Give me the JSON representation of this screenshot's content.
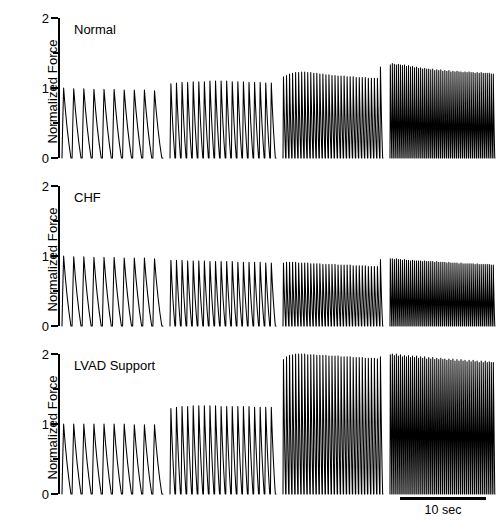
{
  "figure": {
    "axis_label": "Normalized Force",
    "y_ticks": [
      "0",
      "1",
      "2"
    ],
    "scalebar_label": "10 sec"
  },
  "panels": [
    {
      "title": "Normal"
    },
    {
      "title": "CHF"
    },
    {
      "title": "LVAD Support"
    }
  ],
  "chart_data": {
    "type": "line",
    "title": "",
    "xlabel": "",
    "ylabel": "Normalized Force",
    "ylim": [
      0,
      2
    ],
    "y_ticks": [
      0,
      0.5,
      1,
      1.5,
      2
    ],
    "y_tick_labels": [
      "0",
      "",
      "1",
      "",
      "2"
    ],
    "grid": false,
    "legend": "none",
    "x_scalebar": {
      "label": "10 sec",
      "length_sec": 10
    },
    "stimulation_groups": [
      {
        "group": 1,
        "beats": 10,
        "relative_rate": 1.0
      },
      {
        "group": 2,
        "beats": 19,
        "relative_rate": 1.9
      },
      {
        "group": 3,
        "beats": 33,
        "relative_rate": 3.3
      },
      {
        "group": 4,
        "beats": 52,
        "relative_rate": 5.2
      }
    ],
    "series": [
      {
        "name": "Normal",
        "peak_force_by_group": [
          1.0,
          1.08,
          1.2,
          1.32
        ],
        "peak_values": [
          1.0,
          0.99,
          0.99,
          0.98,
          0.98,
          0.98,
          0.97,
          0.97,
          0.97,
          0.96,
          1.06,
          1.07,
          1.08,
          1.08,
          1.09,
          1.09,
          1.09,
          1.1,
          1.1,
          1.1,
          1.1,
          1.09,
          1.09,
          1.09,
          1.08,
          1.08,
          1.08,
          1.07,
          1.07,
          1.16,
          1.18,
          1.2,
          1.21,
          1.22,
          1.22,
          1.23,
          1.23,
          1.22,
          1.22,
          1.21,
          1.21,
          1.2,
          1.2,
          1.19,
          1.19,
          1.18,
          1.18,
          1.17,
          1.17,
          1.17,
          1.16,
          1.16,
          1.16,
          1.15,
          1.15,
          1.15,
          1.15,
          1.14,
          1.14,
          1.14,
          1.14,
          1.3,
          1.33,
          1.35,
          1.34,
          1.33,
          1.34,
          1.33,
          1.32,
          1.33,
          1.31,
          1.32,
          1.3,
          1.31,
          1.29,
          1.3,
          1.28,
          1.29,
          1.27,
          1.28,
          1.27,
          1.27,
          1.26,
          1.27,
          1.25,
          1.26,
          1.25,
          1.26,
          1.24,
          1.25,
          1.24,
          1.25,
          1.23,
          1.24,
          1.23,
          1.24,
          1.23,
          1.23,
          1.22,
          1.23,
          1.22,
          1.23,
          1.22,
          1.22,
          1.21,
          1.22,
          1.21,
          1.22,
          1.21,
          1.21,
          1.21,
          1.21,
          1.2
        ]
      },
      {
        "name": "CHF",
        "peak_force_by_group": [
          1.0,
          0.94,
          0.9,
          0.95
        ],
        "peak_values": [
          1.0,
          0.99,
          0.99,
          0.98,
          0.98,
          0.98,
          0.97,
          0.97,
          0.97,
          0.96,
          0.94,
          0.94,
          0.94,
          0.93,
          0.93,
          0.93,
          0.93,
          0.92,
          0.92,
          0.92,
          0.92,
          0.92,
          0.91,
          0.91,
          0.91,
          0.91,
          0.91,
          0.9,
          0.9,
          0.9,
          0.91,
          0.91,
          0.91,
          0.91,
          0.9,
          0.9,
          0.9,
          0.9,
          0.89,
          0.89,
          0.89,
          0.89,
          0.88,
          0.88,
          0.88,
          0.88,
          0.88,
          0.87,
          0.87,
          0.87,
          0.87,
          0.87,
          0.86,
          0.86,
          0.86,
          0.86,
          0.86,
          0.85,
          0.85,
          0.85,
          0.85,
          0.95,
          0.96,
          0.96,
          0.95,
          0.96,
          0.95,
          0.95,
          0.94,
          0.95,
          0.94,
          0.94,
          0.93,
          0.94,
          0.93,
          0.93,
          0.93,
          0.93,
          0.92,
          0.93,
          0.92,
          0.92,
          0.92,
          0.92,
          0.91,
          0.92,
          0.91,
          0.91,
          0.91,
          0.91,
          0.9,
          0.91,
          0.9,
          0.9,
          0.9,
          0.9,
          0.89,
          0.9,
          0.89,
          0.89,
          0.89,
          0.89,
          0.89,
          0.89,
          0.88,
          0.89,
          0.88,
          0.88,
          0.88,
          0.88,
          0.88,
          0.88,
          0.87
        ]
      },
      {
        "name": "LVAD Support",
        "peak_force_by_group": [
          1.0,
          1.25,
          1.98,
          2.0
        ],
        "peak_values": [
          1.0,
          1.0,
          1.0,
          1.0,
          1.0,
          1.0,
          1.0,
          0.99,
          0.99,
          0.99,
          1.22,
          1.24,
          1.25,
          1.25,
          1.26,
          1.26,
          1.26,
          1.26,
          1.26,
          1.25,
          1.25,
          1.25,
          1.25,
          1.25,
          1.25,
          1.24,
          1.24,
          1.24,
          1.24,
          1.92,
          1.96,
          1.98,
          1.99,
          2.0,
          2.0,
          2.0,
          2.0,
          1.99,
          1.99,
          1.99,
          1.98,
          1.98,
          1.98,
          1.98,
          1.97,
          1.97,
          1.97,
          1.97,
          1.96,
          1.96,
          1.96,
          1.96,
          1.95,
          1.95,
          1.95,
          1.95,
          1.94,
          1.94,
          1.94,
          1.94,
          1.93,
          1.96,
          1.99,
          2.0,
          1.98,
          2.0,
          1.97,
          1.99,
          1.96,
          1.98,
          1.96,
          1.98,
          1.95,
          1.97,
          1.95,
          1.97,
          1.94,
          1.96,
          1.94,
          1.96,
          1.93,
          1.95,
          1.93,
          1.95,
          1.92,
          1.94,
          1.92,
          1.94,
          1.92,
          1.93,
          1.91,
          1.93,
          1.91,
          1.93,
          1.9,
          1.92,
          1.9,
          1.92,
          1.9,
          1.91,
          1.89,
          1.91,
          1.89,
          1.91,
          1.89,
          1.9,
          1.88,
          1.9,
          1.88,
          1.9,
          1.88,
          1.89,
          1.88
        ]
      }
    ]
  }
}
